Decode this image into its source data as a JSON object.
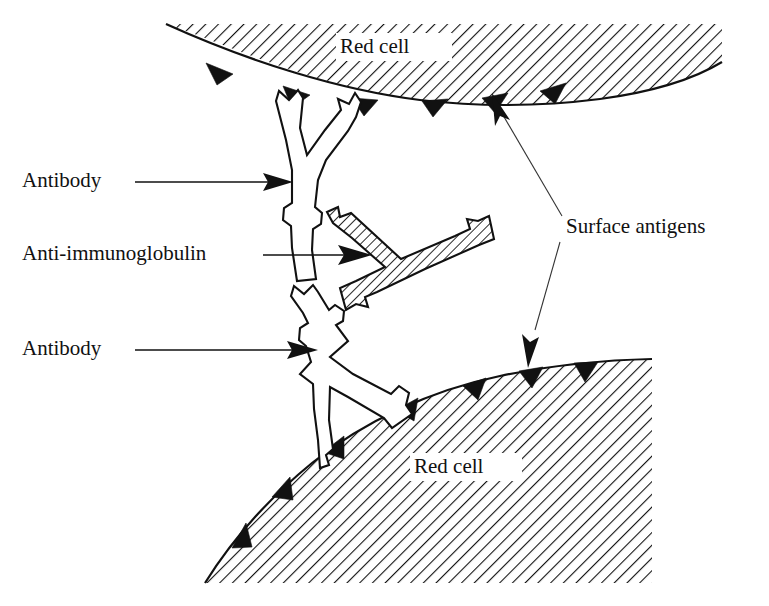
{
  "figure": {
    "background_color": "#ffffff",
    "line_color": "#111111",
    "width": 769,
    "height": 606
  },
  "labels": {
    "antibody_top": "Antibody",
    "anti_immunoglobulin": "Anti-immunoglobulin",
    "antibody_bottom": "Antibody",
    "surface_antigens": "Surface antigens",
    "red_cell_top": "Red cell",
    "red_cell_bottom": "Red cell"
  },
  "elements": {
    "top_cell": {
      "name": "red-cell-top",
      "label": "Red cell",
      "fill_pattern": "diagonal-hatch",
      "antigen_count": 5
    },
    "bottom_cell": {
      "name": "red-cell-bottom",
      "label": "Red cell",
      "fill_pattern": "diagonal-hatch",
      "antigen_count": 6
    },
    "antibody_upper": {
      "name": "antibody-upper",
      "shape": "Y-shaped immunoglobulin",
      "fill": "white"
    },
    "antibody_lower": {
      "name": "antibody-lower",
      "shape": "Y-shaped immunoglobulin",
      "fill": "white"
    },
    "anti_immunoglobulin_molecule": {
      "name": "anti-immunoglobulin-molecule",
      "shape": "Y-shaped immunoglobulin",
      "fill": "diagonal-hatch"
    }
  },
  "leaders": {
    "antibody_top_arrow": "arrow-right",
    "anti_immunoglobulin_arrow": "arrow-right",
    "antibody_bottom_arrow": "arrow-right",
    "surface_antigens_upper": "arrow-up-left",
    "surface_antigens_lower": "arrow-down-left"
  }
}
